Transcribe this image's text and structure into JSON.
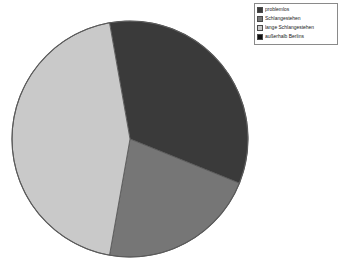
{
  "legend": {
    "position": "top-right",
    "items": [
      {
        "label": "problemlos",
        "color": "#3a3a3a"
      },
      {
        "label": "Schlangestehen",
        "color": "#767676"
      },
      {
        "label": "lange Schlangestehen",
        "color": "#c9c9c9"
      },
      {
        "label": "außerhalb Berlins",
        "color": "#111111"
      }
    ]
  },
  "chart_data": {
    "type": "pie",
    "title": "",
    "subtitle": "",
    "xlabel": "",
    "ylabel": "",
    "grid": false,
    "legend_position": "top-right",
    "categories": [
      "problemlos",
      "Schlangestehen",
      "lange Schlangestehen",
      "außerhalb Berlins"
    ],
    "values": [
      34,
      22,
      44,
      0
    ],
    "units": "percent",
    "start_angle_deg": -100,
    "direction": "clockwise",
    "slices": [
      {
        "name": "problemlos",
        "value": 34,
        "angle_deg": 122,
        "color": "#3a3a3a",
        "start_deg": -100,
        "end_deg": 22
      },
      {
        "name": "Schlangestehen",
        "value": 22,
        "angle_deg": 78,
        "color": "#767676",
        "start_deg": 22,
        "end_deg": 100
      },
      {
        "name": "lange Schlangestehen",
        "value": 44,
        "angle_deg": 160,
        "color": "#c9c9c9",
        "start_deg": 100,
        "end_deg": 260
      },
      {
        "name": "außerhalb Berlins",
        "value": 0,
        "angle_deg": 0,
        "color": "#111111",
        "start_deg": 260,
        "end_deg": 260
      }
    ],
    "center": {
      "x": 130,
      "y": 139
    },
    "radius": 118,
    "outline_color": "#5a5a5a"
  }
}
